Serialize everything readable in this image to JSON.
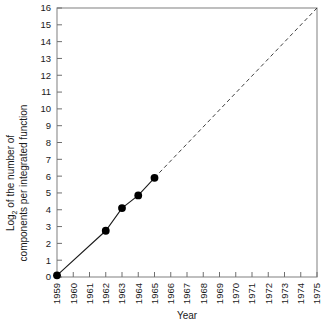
{
  "chart_data": {
    "type": "line",
    "title": "",
    "xlabel": "Year",
    "ylabel_line1": "Log2 of the number of",
    "ylabel_line2": "components per integrated function",
    "ylabel_prefix": "Log",
    "ylabel_subscript": "2",
    "ylabel_rest": " of the number of",
    "x": [
      1959,
      1962,
      1963,
      1964,
      1965
    ],
    "values": [
      0.1,
      2.75,
      4.1,
      4.85,
      5.9
    ],
    "series": [
      {
        "name": "Observed components per integrated function",
        "style": "solid-with-markers",
        "x": [
          1959,
          1962,
          1963,
          1964,
          1965
        ],
        "values": [
          0.1,
          2.75,
          4.1,
          4.85,
          5.9
        ]
      },
      {
        "name": "Extrapolation",
        "style": "dashed",
        "x": [
          1965,
          1975
        ],
        "values": [
          5.9,
          16
        ]
      }
    ],
    "xlim": [
      1959,
      1975
    ],
    "ylim": [
      0,
      16
    ],
    "xticks": [
      1959,
      1960,
      1961,
      1962,
      1963,
      1964,
      1965,
      1966,
      1967,
      1968,
      1969,
      1970,
      1971,
      1972,
      1973,
      1974,
      1975
    ],
    "yticks": [
      0,
      1,
      2,
      3,
      4,
      5,
      6,
      7,
      8,
      9,
      10,
      11,
      12,
      13,
      14,
      15,
      16
    ],
    "xtick_labels": [
      "1959",
      "1960",
      "1961",
      "1962",
      "1963",
      "1964",
      "1965",
      "1966",
      "1967",
      "1968",
      "1969",
      "1970",
      "1971",
      "1972",
      "1973",
      "1974",
      "1975"
    ],
    "ytick_labels": [
      "0",
      "1",
      "2",
      "3",
      "4",
      "5",
      "6",
      "7",
      "8",
      "9",
      "10",
      "11",
      "12",
      "13",
      "14",
      "15",
      "16"
    ],
    "grid": false,
    "legend": "none",
    "colors": {
      "line": "#1a1a1a",
      "marker": "#000000",
      "frame": "#8a8a8a",
      "text": "#1a1a1a",
      "background": "#ffffff"
    }
  }
}
